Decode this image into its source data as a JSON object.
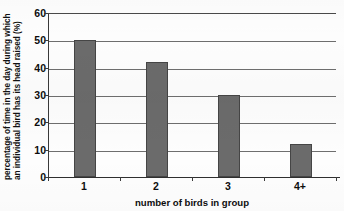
{
  "chart_data": {
    "type": "bar",
    "title": "",
    "subtitle": "",
    "xlabel": "number of birds in group",
    "ylabel": "percentage of time in the day during which an individual bird has its head raised (%)",
    "ylabel_lines": [
      "percentage of time in the day during which",
      "an individual bird has its head raised  (%)"
    ],
    "categories": [
      "1",
      "2",
      "3",
      "4+"
    ],
    "values": [
      50,
      42,
      30,
      12
    ],
    "ylim": [
      0,
      60
    ],
    "ytick_step": 10,
    "yticks": [
      "0",
      "10",
      "20",
      "30",
      "40",
      "50",
      "60"
    ],
    "grid": true,
    "grid_axis": "y",
    "legend": "none",
    "bar_color": "#6b6b6b",
    "bar_edge_color": "#454545",
    "axis_color": "#3a3a3a",
    "background_color": "#fdfdfd",
    "series": [
      {
        "name": "percentage of time head raised",
        "values": [
          50,
          42,
          30,
          12
        ]
      }
    ]
  }
}
